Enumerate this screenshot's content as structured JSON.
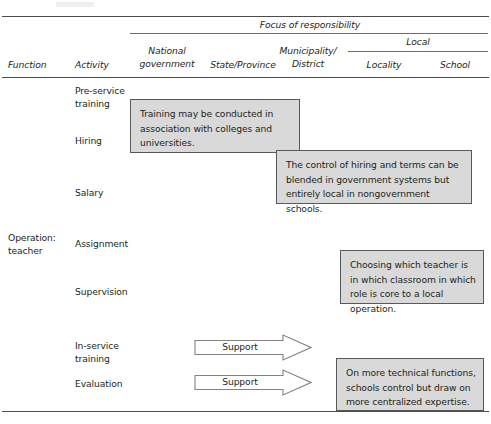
{
  "table": {
    "spanner": "Focus of responsibility",
    "columns": {
      "function": "Function",
      "activity": "Activity",
      "national_government": "National\ngovernment",
      "state_province": "State/Province",
      "municipality_district": "Municipality/\nDistrict",
      "local": "Local",
      "locality": "Locality",
      "school": "School"
    },
    "groups": [
      {
        "function": "",
        "activities": [
          "Pre-service\ntraining",
          "Hiring",
          "Salary"
        ]
      },
      {
        "function": "Operation:\nteacher",
        "activities": [
          "Assignment",
          "Supervision",
          "In-service\ntraining",
          "Evaluation"
        ]
      }
    ],
    "function_labels": {
      "operation_teacher": "Operation:\nteacher"
    },
    "activity_labels": {
      "pre_service_training": "Pre-service\ntraining",
      "hiring": "Hiring",
      "salary": "Salary",
      "assignment": "Assignment",
      "supervision": "Supervision",
      "in_service_training": "In-service\ntraining",
      "evaluation": "Evaluation"
    }
  },
  "callouts": [
    {
      "id": "training-colleges",
      "text": "Training may be conducted in association with colleges and universities."
    },
    {
      "id": "hiring-control",
      "text": "The control of hiring and terms can be blended in government systems but entirely local in nongovernment schools."
    },
    {
      "id": "teacher-assignment",
      "text": "Choosing which teacher is in which classroom in which role is core to a local operation."
    },
    {
      "id": "technical-functions",
      "text": "On more technical functions, schools control but draw on more centralized expertise."
    }
  ],
  "arrows": [
    {
      "id": "support-in-service-training",
      "label": "Support"
    },
    {
      "id": "support-evaluation",
      "label": "Support"
    }
  ],
  "colors": {
    "callout_fill": "#d9d9d9",
    "callout_border": "#58595b",
    "rule": "#4d4d4d",
    "text": "#231f20",
    "arrow_stroke": "#808285"
  }
}
